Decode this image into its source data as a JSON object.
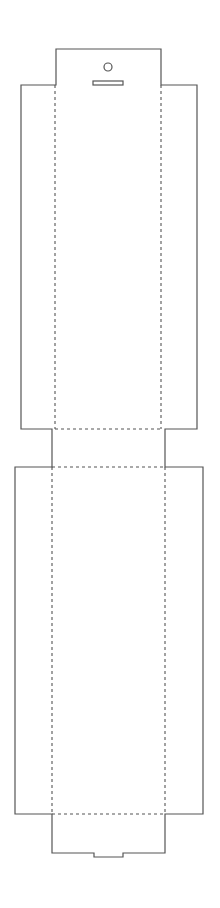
{
  "diagram": {
    "title": "Packaging die-cut template (hang-tab sleeve)",
    "type": "die-line",
    "colors": {
      "background": "#ffffff",
      "cut_line": "#555555",
      "fold_line": "#555555"
    },
    "line_styles": {
      "cut": "solid",
      "fold": "dashed"
    },
    "parts": [
      {
        "name": "hang-tab",
        "features": [
          "hang-hole",
          "hang-slot"
        ]
      },
      {
        "name": "upper-panel-with-side-flaps"
      },
      {
        "name": "neck-panel"
      },
      {
        "name": "lower-panel-with-side-flaps"
      },
      {
        "name": "bottom-tuck-flap",
        "features": [
          "notch"
        ]
      }
    ],
    "geometry": {
      "hang_tab": {
        "x1": 56,
        "x2": 161,
        "y1": 49,
        "y2": 85
      },
      "hang_hole": {
        "cx": 108,
        "cy": 67,
        "r": 4
      },
      "hang_slot": {
        "x": 93,
        "y": 81,
        "w": 30,
        "h": 4
      },
      "upper_panel": {
        "flap_left": 21,
        "flap_right": 197,
        "fold_left": 55,
        "fold_right": 161,
        "y1": 85,
        "y2": 429
      },
      "neck": {
        "x1": 52,
        "x2": 165,
        "y1": 429,
        "y2": 467
      },
      "lower_panel": {
        "flap_left": 15,
        "flap_right": 203,
        "fold_left": 52,
        "fold_right": 165,
        "y1": 467,
        "y2": 814
      },
      "bottom_flap": {
        "x1": 52,
        "x2": 165,
        "y1": 814,
        "y2": 853,
        "notch_x1": 94,
        "notch_x2": 123,
        "notch_depth": 4
      }
    }
  }
}
